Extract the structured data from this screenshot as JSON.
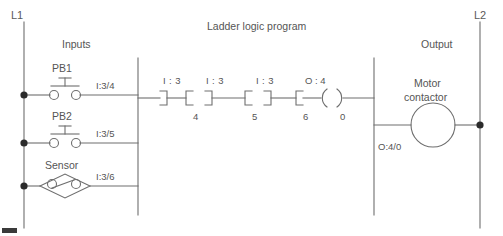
{
  "diagram": {
    "title": "Ladder logic program",
    "rails": {
      "left_label": "L1",
      "right_label": "L2"
    },
    "sections": {
      "inputs_header": "Inputs",
      "output_header": "Output"
    },
    "field_inputs": [
      {
        "device": "PB1",
        "symbol": "push-button-no",
        "address": "I:3/4"
      },
      {
        "device": "PB2",
        "symbol": "push-button-no",
        "address": "I:3/5"
      },
      {
        "device": "Sensor",
        "symbol": "limit-switch-no",
        "address": "I:3/6"
      }
    ],
    "rung": {
      "contacts": [
        {
          "address": "I : 3",
          "bit": "4",
          "type": "examine-if-closed"
        },
        {
          "address": "I : 3",
          "bit": "5",
          "type": "examine-if-closed"
        },
        {
          "address": "I : 3",
          "bit": "6",
          "type": "examine-if-closed"
        }
      ],
      "coil": {
        "address": "O : 4",
        "bit": "0",
        "type": "output-energize"
      }
    },
    "field_output": {
      "device_line1": "Motor",
      "device_line2": "contactor",
      "address": "O:4/0",
      "symbol": "contactor-coil-circle"
    }
  },
  "colors": {
    "line": "#6e6e6e",
    "text": "#555555",
    "node": "#2b2b2b",
    "background": "#ffffff"
  }
}
